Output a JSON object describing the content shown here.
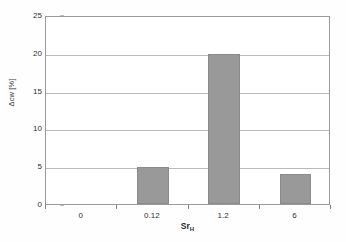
{
  "chart_data": {
    "type": "bar",
    "title": "",
    "subtitle": "",
    "xlabel": "Sr",
    "xlabel_sub": "H",
    "xlabel_full": "SrH",
    "ylabel": "Δcw [%]",
    "categories": [
      "0",
      "0.12",
      "1.2",
      "6"
    ],
    "values": [
      0,
      4.9,
      19.8,
      4.0
    ],
    "series": [
      {
        "name": "Δcw",
        "values": [
          0,
          4.9,
          19.8,
          4.0
        ]
      }
    ],
    "ylim": [
      0,
      25
    ],
    "yticks": [
      0,
      5,
      10,
      15,
      20,
      25
    ],
    "ytick_labels": [
      "0",
      "5",
      "10",
      "15",
      "20",
      "25"
    ],
    "xtick_labels": [
      "0",
      "0.12",
      "1.2",
      "6"
    ],
    "grid": "horizontal",
    "legend": "none",
    "bar_color": "#999999",
    "bar_edge_color": "#8a8a8a",
    "grid_color": "#b9b9b9",
    "frame_color": "#9a9a9a",
    "background": "#ffffff",
    "annotations": []
  }
}
